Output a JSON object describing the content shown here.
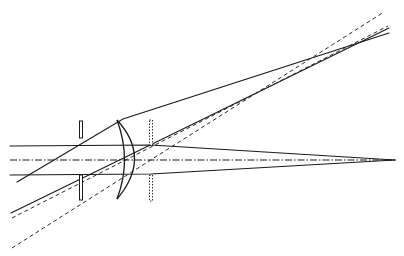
{
  "diagram": {
    "title": "",
    "colors": {
      "line": "#1a1a1a",
      "background": "#ffffff"
    },
    "optical_axis": {
      "x1": 10,
      "y1": 160,
      "x2": 396,
      "y2": 160
    },
    "front_stop": {
      "x": 81,
      "top": [
        121,
        138
      ],
      "bottom": [
        175,
        200
      ]
    },
    "rear_stop_dotted": {
      "x": 151,
      "top": [
        120,
        145
      ],
      "bottom": [
        175,
        201
      ]
    },
    "lens": {
      "top": [
        117,
        120
      ],
      "bottom": [
        117,
        199
      ],
      "bulge_x": 139
    },
    "axial_rays": [
      {
        "points": [
          [
            10,
            146
          ],
          [
            151,
            145
          ],
          [
            395,
            160
          ]
        ]
      },
      {
        "points": [
          [
            10,
            175
          ],
          [
            151,
            174
          ],
          [
            395,
            160
          ]
        ]
      }
    ],
    "oblique_solid_rays": [
      {
        "points": [
          [
            17,
            182
          ],
          [
            123,
            119
          ],
          [
            389,
            33
          ]
        ]
      },
      {
        "points": [
          [
            11,
            213
          ],
          [
            140,
            150
          ],
          [
            389,
            28
          ]
        ]
      }
    ],
    "oblique_dashed_rays": [
      {
        "points": [
          [
            12,
            218
          ],
          [
            388,
            26
          ]
        ]
      },
      {
        "points": [
          [
            12,
            248
          ],
          [
            384,
            12
          ]
        ]
      }
    ]
  }
}
